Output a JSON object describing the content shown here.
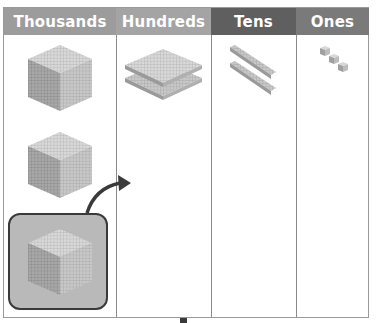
{
  "chart": {
    "columns": [
      {
        "label": "Thousands",
        "header_color": "#9c9c9c",
        "blocks": [
          "thousand-cube",
          "thousand-cube",
          "thousand-cube"
        ],
        "highlighted_block_index": 2
      },
      {
        "label": "Hundreds",
        "header_color": "#a4a4a4",
        "blocks": [
          "hundred-flat",
          "hundred-flat"
        ]
      },
      {
        "label": "Tens",
        "header_color": "#5f5f5f",
        "blocks": [
          "ten-rod",
          "ten-rod"
        ]
      },
      {
        "label": "Ones",
        "header_color": "#7a7a7a",
        "blocks": [
          "one-unit",
          "one-unit",
          "one-unit"
        ]
      }
    ],
    "annotation": "arrow from highlighted thousand cube to Hundreds column (regrouping)"
  },
  "colors": {
    "highlight_fill": "#b9b9b9",
    "highlight_border": "#3a3a3a",
    "arrow": "#3a3a3a"
  }
}
